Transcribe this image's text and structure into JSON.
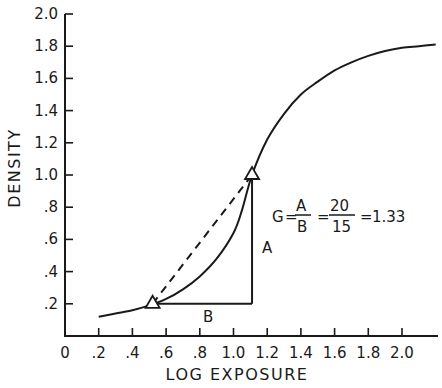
{
  "chart_data": {
    "type": "line",
    "title": "",
    "xlabel": "LOG EXPOSURE",
    "ylabel": "DENSITY",
    "xlim": [
      0,
      2.2
    ],
    "ylim": [
      0,
      2.0
    ],
    "grid": false,
    "x_ticks": [
      "0",
      ".2",
      ".4",
      ".6",
      ".8",
      "1.0",
      "1.2",
      "1.4",
      "1.6",
      "1.8",
      "2.0"
    ],
    "y_ticks": [
      ".2",
      ".4",
      ".6",
      ".8",
      "1.0",
      "1.2",
      "1.4",
      "1.6",
      "1.8",
      "2.0"
    ],
    "series": [
      {
        "name": "characteristic curve",
        "x": [
          0.2,
          0.3,
          0.4,
          0.5,
          0.6,
          0.7,
          0.8,
          0.9,
          1.0,
          1.05,
          1.11,
          1.2,
          1.3,
          1.4,
          1.5,
          1.6,
          1.7,
          1.8,
          1.9,
          2.0,
          2.1,
          2.2
        ],
        "y": [
          0.12,
          0.14,
          0.16,
          0.19,
          0.23,
          0.29,
          0.37,
          0.48,
          0.64,
          0.78,
          1.0,
          1.22,
          1.38,
          1.5,
          1.58,
          1.65,
          1.7,
          1.74,
          1.77,
          1.79,
          1.8,
          1.81
        ]
      }
    ],
    "markers": [
      {
        "shape": "triangle",
        "x": 0.52,
        "y": 0.2
      },
      {
        "shape": "triangle",
        "x": 1.11,
        "y": 1.0
      }
    ],
    "annotations": {
      "dashed_line": {
        "from": [
          0.52,
          0.2
        ],
        "to": [
          1.11,
          1.0
        ]
      },
      "side_A": {
        "label": "A",
        "from": [
          1.11,
          0.2
        ],
        "to": [
          1.11,
          1.0
        ]
      },
      "side_B": {
        "label": "B",
        "from": [
          0.52,
          0.2
        ],
        "to": [
          1.11,
          0.2
        ]
      },
      "equation": {
        "lhs": "G",
        "num1": "A",
        "den1": "B",
        "num2": "20",
        "den2": "15",
        "result": "1.33"
      }
    }
  },
  "labels": {
    "xlabel": "LOG EXPOSURE",
    "ylabel": "DENSITY",
    "side_a": "A",
    "side_b": "B",
    "eq_g": "G",
    "eq_eq": "=",
    "eq_num1": "A",
    "eq_den1": "B",
    "eq_num2": "20",
    "eq_den2": "15",
    "eq_result": "1.33"
  },
  "ticks": {
    "x": [
      "0",
      ".2",
      ".4",
      ".6",
      ".8",
      "1.0",
      "1.2",
      "1.4",
      "1.6",
      "1.8",
      "2.0"
    ],
    "y": [
      ".2",
      ".4",
      ".6",
      ".8",
      "1.0",
      "1.2",
      "1.4",
      "1.6",
      "1.8",
      "2.0"
    ]
  }
}
